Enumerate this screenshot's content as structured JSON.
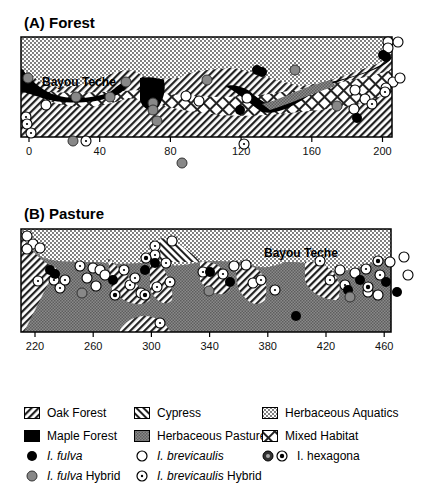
{
  "panels": {
    "forest": {
      "title": "(A) Forest",
      "water_label": "Bayou Teche",
      "x_ticks": [
        "0",
        "40",
        "80",
        "120",
        "160",
        "200"
      ]
    },
    "pasture": {
      "title": "(B) Pasture",
      "water_label": "Bayou Teche",
      "x_ticks": [
        "220",
        "260",
        "300",
        "340",
        "380",
        "420",
        "460"
      ]
    }
  },
  "legend": {
    "habitats": [
      {
        "id": "oak-forest",
        "label": "Oak Forest"
      },
      {
        "id": "cypress",
        "label": "Cypress"
      },
      {
        "id": "herbaceous-aquatics",
        "label": "Herbaceous Aquatics"
      },
      {
        "id": "maple-forest",
        "label": "Maple Forest"
      },
      {
        "id": "herbaceous-pasture",
        "label": "Herbaceous Pasture"
      },
      {
        "id": "mixed-habitat",
        "label": "Mixed Habitat"
      }
    ],
    "species": {
      "fulva": {
        "italic": "I. fulva",
        "suffix": ""
      },
      "fulva_hybrid": {
        "italic": "I. fulva",
        "suffix": " Hybrid"
      },
      "brevicaulis": {
        "italic": "I. brevicaulis",
        "suffix": ""
      },
      "brevicaulis_hybrid": {
        "italic": "I. brevicaulis",
        "suffix": " Hybrid"
      },
      "hexagona": {
        "label": "I. hexagona"
      }
    }
  }
}
